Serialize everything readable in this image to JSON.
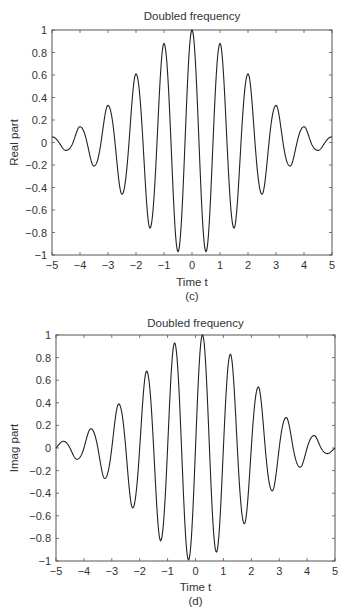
{
  "chart_data": [
    {
      "id": "c",
      "type": "line",
      "title": "Doubled frequency",
      "xlabel": "Time t",
      "ylabel": "Real part",
      "caption": "(c)",
      "xlim": [
        -5,
        5
      ],
      "ylim": [
        -1,
        1
      ],
      "xticks": [
        "−5",
        "−4",
        "−3",
        "−2",
        "−1",
        "0",
        "1",
        "2",
        "3",
        "4",
        "5"
      ],
      "yticks": [
        "−1",
        "−0.8",
        "−0.6",
        "−0.4",
        "−0.2",
        "0",
        "0.2",
        "0.4",
        "0.6",
        "0.8",
        "1"
      ],
      "grid": false,
      "series": [
        {
          "name": "Real part",
          "formula": "exp(-t^2/8)*cos(2*pi*t)",
          "extrema": [
            {
              "t": -5,
              "y": 0.05
            },
            {
              "t": -4.5,
              "y": -0.07
            },
            {
              "t": -4,
              "y": 0.14
            },
            {
              "t": -3.5,
              "y": -0.21
            },
            {
              "t": -3,
              "y": 0.33
            },
            {
              "t": -2.5,
              "y": -0.46
            },
            {
              "t": -2,
              "y": 0.61
            },
            {
              "t": -1.5,
              "y": -0.76
            },
            {
              "t": -1,
              "y": 0.88
            },
            {
              "t": -0.5,
              "y": -0.97
            },
            {
              "t": 0,
              "y": 1.0
            },
            {
              "t": 0.5,
              "y": -0.97
            },
            {
              "t": 1,
              "y": 0.88
            },
            {
              "t": 1.5,
              "y": -0.76
            },
            {
              "t": 2,
              "y": 0.61
            },
            {
              "t": 2.5,
              "y": -0.46
            },
            {
              "t": 3,
              "y": 0.33
            },
            {
              "t": 3.5,
              "y": -0.21
            },
            {
              "t": 4,
              "y": 0.14
            },
            {
              "t": 4.5,
              "y": -0.07
            },
            {
              "t": 5,
              "y": 0.05
            }
          ]
        }
      ]
    },
    {
      "id": "d",
      "type": "line",
      "title": "Doubled frequency",
      "xlabel": "Time t",
      "ylabel": "Imag part",
      "caption": "(d)",
      "xlim": [
        -5,
        5
      ],
      "ylim": [
        -1,
        1
      ],
      "xticks": [
        "−5",
        "−4",
        "−3",
        "−2",
        "−1",
        "0",
        "1",
        "2",
        "3",
        "4",
        "5"
      ],
      "yticks": [
        "−1",
        "−0.8",
        "−0.6",
        "−0.4",
        "−0.2",
        "0",
        "0.2",
        "0.4",
        "0.6",
        "0.8",
        "1"
      ],
      "grid": false,
      "series": [
        {
          "name": "Imag part",
          "formula": "envelope(t)*sin(2*pi*t)",
          "extrema": [
            {
              "t": -4.75,
              "y": 0.06
            },
            {
              "t": -4.25,
              "y": -0.1
            },
            {
              "t": -3.75,
              "y": 0.17
            },
            {
              "t": -3.25,
              "y": -0.27
            },
            {
              "t": -2.75,
              "y": 0.39
            },
            {
              "t": -2.25,
              "y": -0.53
            },
            {
              "t": -1.75,
              "y": 0.68
            },
            {
              "t": -1.25,
              "y": -0.82
            },
            {
              "t": -0.75,
              "y": 0.93
            },
            {
              "t": -0.25,
              "y": -0.99
            },
            {
              "t": 0.25,
              "y": 1.0
            },
            {
              "t": 0.75,
              "y": -0.92
            },
            {
              "t": 1.25,
              "y": 0.83
            },
            {
              "t": 1.75,
              "y": -0.67
            },
            {
              "t": 2.25,
              "y": 0.54
            },
            {
              "t": 2.75,
              "y": -0.38
            },
            {
              "t": 3.25,
              "y": 0.27
            },
            {
              "t": 3.75,
              "y": -0.17
            },
            {
              "t": 4.25,
              "y": 0.11
            },
            {
              "t": 4.75,
              "y": -0.05
            }
          ]
        }
      ]
    }
  ],
  "layout": {
    "panels": [
      {
        "left": 52,
        "top": 30,
        "right": 332,
        "bottom": 255,
        "title_y": 20,
        "xlabel_y": 286,
        "caption_y": 300,
        "ylabel_x": 18
      },
      {
        "left": 56,
        "top": 335,
        "right": 335,
        "bottom": 561,
        "title_y": 327,
        "xlabel_y": 591,
        "caption_y": 605,
        "ylabel_x": 18
      }
    ]
  }
}
